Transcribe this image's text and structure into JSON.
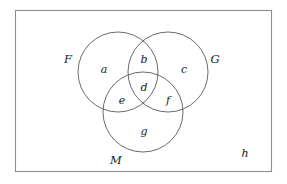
{
  "figure": {
    "kind": "venn-diagram",
    "universe": {
      "name": "universal-set-rectangle",
      "outside_label": "h"
    },
    "sets": [
      {
        "id": "F",
        "label": "F",
        "role": "left-set",
        "cx": 118,
        "cy": 72,
        "r": 40,
        "label_x": 68,
        "label_y": 60
      },
      {
        "id": "G",
        "label": "G",
        "role": "right-set",
        "cx": 168,
        "cy": 72,
        "r": 40,
        "label_x": 215,
        "label_y": 60
      },
      {
        "id": "M",
        "label": "M",
        "role": "bottom-set",
        "cx": 143,
        "cy": 112,
        "r": 40,
        "label_x": 116,
        "label_y": 161
      }
    ],
    "regions": [
      {
        "id": "a",
        "label": "a",
        "meaning": "F only",
        "x": 104,
        "y": 70
      },
      {
        "id": "b",
        "label": "b",
        "meaning": "F and G only",
        "x": 144,
        "y": 60
      },
      {
        "id": "c",
        "label": "c",
        "meaning": "G only",
        "x": 184,
        "y": 70
      },
      {
        "id": "d",
        "label": "d",
        "meaning": "F and G and M",
        "x": 144,
        "y": 88
      },
      {
        "id": "e",
        "label": "e",
        "meaning": "F and M only",
        "x": 122,
        "y": 101
      },
      {
        "id": "f",
        "label": "f",
        "meaning": "G and M only",
        "x": 168,
        "y": 101
      },
      {
        "id": "g",
        "label": "g",
        "meaning": "M only",
        "x": 144,
        "y": 132
      },
      {
        "id": "h",
        "label": "h",
        "meaning": "outside all sets",
        "x": 245,
        "y": 154
      }
    ],
    "colors": {
      "background": "#ffffff",
      "circle_stroke": "#555a5e",
      "rect_stroke": "#8a8d91",
      "text": "#1a1a1a"
    }
  },
  "chart_data": {
    "type": "diagram",
    "title": "",
    "subtitle": "",
    "categories": [
      "a",
      "b",
      "c",
      "d",
      "e",
      "f",
      "g",
      "h"
    ],
    "series": [
      {
        "name": "regions",
        "values": [
          "a",
          "b",
          "c",
          "d",
          "e",
          "f",
          "g",
          "h"
        ]
      }
    ],
    "set_names": [
      "F",
      "G",
      "M"
    ],
    "universal_set_label": "h",
    "legend": "none",
    "grid": false
  }
}
